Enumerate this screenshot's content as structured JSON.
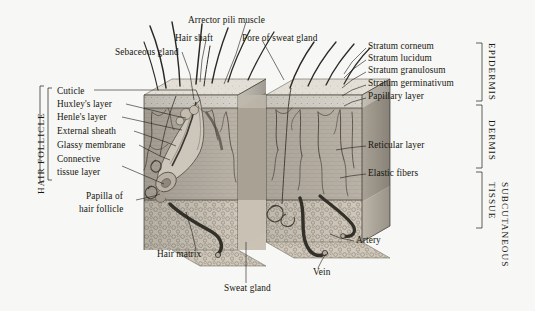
{
  "figure": {
    "style": "engraving",
    "background_color": "#f7f7f5",
    "ink_color": "#22211c"
  },
  "labels_top": [
    {
      "id": "arrector-pili-muscle",
      "text": "Arrector pili muscle",
      "x": 188,
      "y": 15,
      "anchor": "left"
    },
    {
      "id": "hair-shaft",
      "text": "Hair shaft",
      "x": 175,
      "y": 33,
      "anchor": "left"
    },
    {
      "id": "pore-of-sweat-gland",
      "text": "Pore of sweat gland",
      "x": 242,
      "y": 33,
      "anchor": "left"
    },
    {
      "id": "sebaceous-gland",
      "text": "Sebaceous gland",
      "x": 115,
      "y": 47,
      "anchor": "left"
    }
  ],
  "labels_left": [
    {
      "id": "cuticle",
      "text": "Cuticle",
      "x": 57,
      "y": 92
    },
    {
      "id": "huxleys-layer",
      "text": "Huxley's layer",
      "x": 57,
      "y": 106
    },
    {
      "id": "henles-layer",
      "text": "Henle's layer",
      "x": 57,
      "y": 119
    },
    {
      "id": "external-sheath",
      "text": "External sheath",
      "x": 57,
      "y": 133
    },
    {
      "id": "glassy-membrane",
      "text": "Glassy membrane",
      "x": 57,
      "y": 147
    },
    {
      "id": "connective-tissue-layer-1",
      "text": "Connective",
      "x": 57,
      "y": 161
    },
    {
      "id": "connective-tissue-layer-2",
      "text": "tissue layer",
      "x": 57,
      "y": 174
    },
    {
      "id": "papilla-of-hair-follicle-1",
      "text": "Papilla of",
      "x": 86,
      "y": 198
    },
    {
      "id": "papilla-of-hair-follicle-2",
      "text": "hair follicle",
      "x": 81,
      "y": 211
    }
  ],
  "labels_right": [
    {
      "id": "stratum-corneum",
      "text": "Stratum corneum",
      "x": 368,
      "y": 46
    },
    {
      "id": "stratum-lucidum",
      "text": "Stratum lucidum",
      "x": 368,
      "y": 58
    },
    {
      "id": "stratum-granulosum",
      "text": "Stratum granulosum",
      "x": 368,
      "y": 70
    },
    {
      "id": "stratum-germinativum",
      "text": "Stratum germinativum",
      "x": 368,
      "y": 83
    },
    {
      "id": "papillary-layer",
      "text": "Papillary layer",
      "x": 368,
      "y": 96
    },
    {
      "id": "reticular-layer",
      "text": "Reticular layer",
      "x": 368,
      "y": 144
    },
    {
      "id": "elastic-fibers",
      "text": "Elastic fibers",
      "x": 368,
      "y": 172
    },
    {
      "id": "artery",
      "text": "Artery",
      "x": 356,
      "y": 239
    }
  ],
  "labels_bottom": [
    {
      "id": "hair-matrix",
      "text": "Hair matrix",
      "x": 157,
      "y": 254
    },
    {
      "id": "vein",
      "text": "Vein",
      "x": 313,
      "y": 272
    },
    {
      "id": "sweat-gland",
      "text": "Sweat gland",
      "x": 224,
      "y": 287
    }
  ],
  "region_labels": [
    {
      "id": "hair-follicle",
      "text": "HAIR FOLLICLE",
      "orientation": "bottom-to-top",
      "x": 38,
      "y": 196
    },
    {
      "id": "epidermis",
      "text": "EPIDERMIS",
      "orientation": "top-to-bottom",
      "x": 492,
      "y": 44
    },
    {
      "id": "dermis",
      "text": "DERMIS",
      "orientation": "top-to-bottom",
      "x": 492,
      "y": 122
    },
    {
      "id": "subcutaneous",
      "text": "SUBCUTANEOUS",
      "orientation": "top-to-bottom",
      "x": 504,
      "y": 185
    },
    {
      "id": "subcutaneous-tissue",
      "text": "TISSUE",
      "orientation": "top-to-bottom",
      "x": 492,
      "y": 185
    }
  ],
  "anatomy_structures": [
    "hair shaft",
    "sebaceous gland",
    "arrector pili muscle",
    "pore of sweat gland",
    "hair follicle",
    "hair matrix",
    "papilla of hair follicle",
    "sweat gland",
    "artery",
    "vein",
    "epidermis",
    "dermis",
    "subcutaneous tissue"
  ]
}
